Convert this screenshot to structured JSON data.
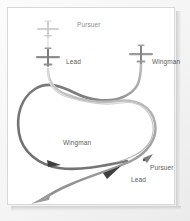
{
  "figure": {
    "background_color": "#ffffff",
    "frame_border_color": "#d8d8d8",
    "label_color": "#5a5a5a"
  },
  "aircraft": [
    {
      "id": "pursuer-top",
      "icon": "airplane-icon",
      "label": "Pursuer",
      "x": 48,
      "y": 22,
      "heading": "down",
      "shade": "#c9c9c9"
    },
    {
      "id": "lead-top",
      "icon": "airplane-icon",
      "label": "Lead",
      "x": 48,
      "y": 57,
      "heading": "down",
      "shade": "#8f8f8f"
    },
    {
      "id": "wingman-top",
      "icon": "airplane-icon",
      "label": "Wingman",
      "x": 141,
      "y": 54,
      "heading": "down",
      "shade": "#9a9a9a"
    }
  ],
  "labels": [
    {
      "id": "label-pursuer-top",
      "text": "Pursuer",
      "x": 70,
      "y": 18,
      "faded": true
    },
    {
      "id": "label-lead-top",
      "text": "Lead",
      "x": 60,
      "y": 55,
      "faded": false
    },
    {
      "id": "label-wingman-top",
      "text": "Wingman",
      "x": 152,
      "y": 55,
      "faded": false
    },
    {
      "id": "label-wingman-mid",
      "text": "Wingman",
      "x": 59,
      "y": 138,
      "faded": false
    },
    {
      "id": "label-pursuer-bottom",
      "text": "Pursuer",
      "x": 148,
      "y": 163,
      "faded": false
    },
    {
      "id": "label-lead-bottom",
      "text": "Lead",
      "x": 128,
      "y": 175,
      "faded": false
    }
  ],
  "paths": [
    {
      "id": "path-lead",
      "name": "lead-flight-path",
      "role": "Lead",
      "color": "#9c9c9c",
      "width": 2.4,
      "description": "Lead aircraft descends, crosses right, loops and exits lower-left"
    },
    {
      "id": "path-wingman",
      "name": "wingman-flight-path",
      "role": "Wingman",
      "color": "#757575",
      "width": 2.6,
      "description": "Wingman descends, crosses left, sweeps around large left loop and exits lower-left"
    },
    {
      "id": "path-pursuer",
      "name": "pursuer-flight-path",
      "role": "Pursuer",
      "color": "#c6c6c6",
      "width": 1.3,
      "description": "Pursuer trails behind the lead, follows the weave and ends at lower right"
    }
  ],
  "legend_note": "Thach weave / defensive crossing maneuver"
}
